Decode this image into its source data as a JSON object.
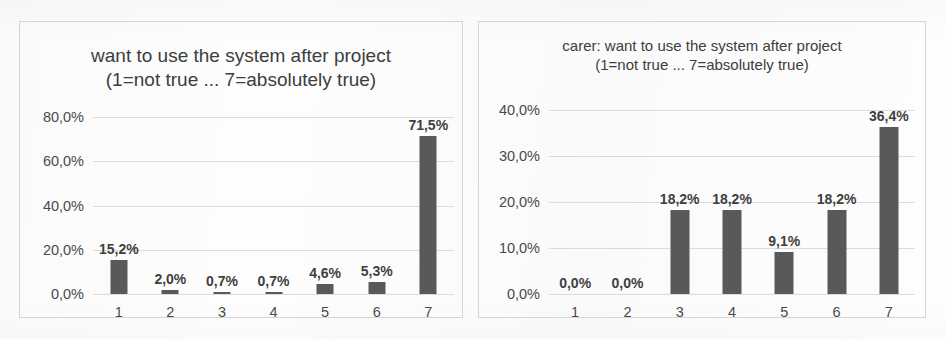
{
  "chart_data": [
    {
      "type": "bar",
      "panel": "left",
      "title": "want to use the system after project",
      "subtitle": "(1=not true ... 7=absolutely true)",
      "xlabel": "",
      "ylabel": "",
      "categories": [
        "1",
        "2",
        "3",
        "4",
        "5",
        "6",
        "7"
      ],
      "values": [
        15.2,
        2.0,
        0.7,
        0.7,
        4.6,
        5.3,
        71.5
      ],
      "value_labels": [
        "15,2%",
        "2,0%",
        "0,7%",
        "0,7%",
        "4,6%",
        "5,3%",
        "71,5%"
      ],
      "ylim": [
        0,
        80
      ],
      "yticks": [
        0,
        20,
        40,
        60,
        80
      ],
      "ytick_labels": [
        "0,0%",
        "20,0%",
        "40,0%",
        "60,0%",
        "80,0%"
      ],
      "grid": true,
      "legend": "none",
      "bar_color": "#595959",
      "gridline_color": "#dcdcdc"
    },
    {
      "type": "bar",
      "panel": "right",
      "title": "carer: want to use the system after project",
      "subtitle": "(1=not true ... 7=absolutely true)",
      "xlabel": "",
      "ylabel": "",
      "categories": [
        "1",
        "2",
        "3",
        "4",
        "5",
        "6",
        "7"
      ],
      "values": [
        0.0,
        0.0,
        18.2,
        18.2,
        9.1,
        18.2,
        36.4
      ],
      "value_labels": [
        "0,0%",
        "0,0%",
        "18,2%",
        "18,2%",
        "9,1%",
        "18,2%",
        "36,4%"
      ],
      "ylim": [
        0,
        40
      ],
      "yticks": [
        0,
        10,
        20,
        30,
        40
      ],
      "ytick_labels": [
        "0,0%",
        "10,0%",
        "20,0%",
        "30,0%",
        "40,0%"
      ],
      "grid": true,
      "legend": "none",
      "bar_color": "#595959",
      "gridline_color": "#dcdcdc"
    }
  ]
}
